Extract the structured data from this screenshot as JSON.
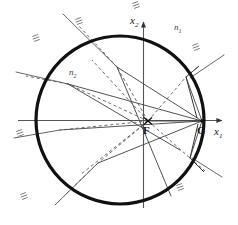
{
  "figure": {
    "background_color": "#ffffff",
    "ink_color": "#1a1a1a",
    "ray_color": "#4a4a4a",
    "axis_color": "#555555",
    "boundary_color": "#111111",
    "width": 238,
    "height": 225
  },
  "axes": {
    "x1": {
      "label": "x",
      "subscript": "1",
      "orientation": "horizontal",
      "arrow": "right",
      "y": 120,
      "x_start": 18,
      "x_end": 225,
      "label_x": 217,
      "label_y": 131
    },
    "x2": {
      "label": "x",
      "subscript": "2",
      "orientation": "vertical",
      "arrow": "up",
      "x": 143,
      "y_start": 208,
      "y_end": 18,
      "label_x": 131,
      "label_y": 16
    }
  },
  "circle": {
    "name": "refracting-boundary",
    "center_x": 120,
    "center_y": 120,
    "radius": 84,
    "stroke_width": 3.2,
    "stroke": "#111111"
  },
  "points": [
    {
      "id": "F",
      "label": "F",
      "x": 148,
      "y": 121,
      "label_x": 144,
      "label_y": 130,
      "marker": "cross"
    },
    {
      "id": "G",
      "label": "G",
      "x": 202,
      "y": 121,
      "label_x": 198,
      "label_y": 130,
      "marker": "dot"
    }
  ],
  "region_labels": [
    {
      "id": "n1",
      "label": "n",
      "subscript": "1",
      "x": 176,
      "y": 27,
      "region": "outside"
    },
    {
      "id": "n2",
      "label": "n",
      "subscript": "2",
      "x": 71,
      "y": 72,
      "region": "inside"
    }
  ],
  "hatch_marks": [
    {
      "x": 36,
      "y": 38,
      "rot": -20
    },
    {
      "x": 79,
      "y": 21,
      "rot": -20
    },
    {
      "x": 196,
      "y": 47,
      "rot": -20
    },
    {
      "x": 20,
      "y": 133,
      "rot": -20
    },
    {
      "x": 24,
      "y": 196,
      "rot": -20
    },
    {
      "x": 180,
      "y": 187,
      "rot": -20
    },
    {
      "x": 136,
      "y": 4,
      "rot": -20
    }
  ],
  "rays": {
    "solid_count": 9,
    "dashed_count": 8,
    "description": "Solid incident/refracted rays and dashed virtual rays radiating from F and converging at G, reflecting at the circular boundary"
  }
}
